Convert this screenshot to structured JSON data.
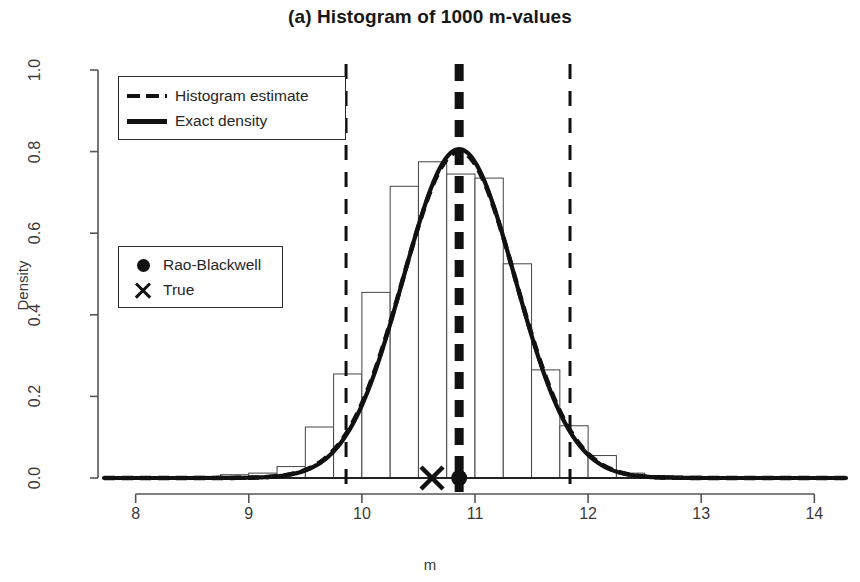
{
  "chart_data": {
    "type": "histogram",
    "title": "(a) Histogram of 1000 m-values",
    "xlabel": "m",
    "ylabel": "Density",
    "xlim": [
      7.72,
      14.28
    ],
    "ylim": [
      0.0,
      1.0
    ],
    "xticks": [
      8,
      9,
      10,
      11,
      12,
      13,
      14
    ],
    "xtick_labels": [
      "8",
      "9",
      "10",
      "11",
      "12",
      "13",
      "14"
    ],
    "yticks": [
      0.0,
      0.2,
      0.4,
      0.6,
      0.8,
      1.0
    ],
    "ytick_labels": [
      "0.0",
      "0.2",
      "0.4",
      "0.6",
      "0.8",
      "1.0"
    ],
    "grid": false,
    "bin_width": 0.25,
    "bins": [
      {
        "left": 8.5,
        "right": 8.75,
        "density": 0.004
      },
      {
        "left": 8.75,
        "right": 9.0,
        "density": 0.008
      },
      {
        "left": 9.0,
        "right": 9.25,
        "density": 0.012
      },
      {
        "left": 9.25,
        "right": 9.5,
        "density": 0.028
      },
      {
        "left": 9.5,
        "right": 9.75,
        "density": 0.125
      },
      {
        "left": 9.75,
        "right": 10.0,
        "density": 0.255
      },
      {
        "left": 10.0,
        "right": 10.25,
        "density": 0.455
      },
      {
        "left": 10.25,
        "right": 10.5,
        "density": 0.715
      },
      {
        "left": 10.5,
        "right": 10.75,
        "density": 0.775
      },
      {
        "left": 10.75,
        "right": 11.0,
        "density": 0.745
      },
      {
        "left": 11.0,
        "right": 11.25,
        "density": 0.735
      },
      {
        "left": 11.25,
        "right": 11.5,
        "density": 0.525
      },
      {
        "left": 11.5,
        "right": 11.75,
        "density": 0.265
      },
      {
        "left": 11.75,
        "right": 12.0,
        "density": 0.128
      },
      {
        "left": 12.0,
        "right": 12.25,
        "density": 0.055
      },
      {
        "left": 12.25,
        "right": 12.5,
        "density": 0.012
      },
      {
        "left": 12.5,
        "right": 12.75,
        "density": 0.006
      }
    ],
    "exact_density": {
      "label": "Exact density",
      "style": "solid",
      "mean": 10.86,
      "sd": 0.495,
      "peak": 0.806
    },
    "histogram_estimate": {
      "label": "Histogram estimate",
      "style": "dashed",
      "mean": 10.86,
      "sd": 0.5,
      "peak": 0.8
    },
    "vertical_lines": [
      {
        "name": "lower-bound",
        "x": 9.86,
        "style": "dashed",
        "width": 3
      },
      {
        "name": "rao-blackwell-estimate",
        "x": 10.86,
        "style": "dashed",
        "width": 9
      },
      {
        "name": "upper-bound",
        "x": 11.84,
        "style": "dashed",
        "width": 3
      }
    ],
    "markers": [
      {
        "name": "True",
        "x": 10.62,
        "y": 0.0,
        "symbol": "cross"
      },
      {
        "name": "Rao-Blackwell",
        "x": 10.86,
        "y": 0.0,
        "symbol": "filled-circle"
      }
    ]
  },
  "legend_lines": {
    "items": [
      {
        "label": "Histogram estimate",
        "key": "dashed-line-key"
      },
      {
        "label": "Exact density",
        "key": "solid-line-key"
      }
    ]
  },
  "legend_points": {
    "items": [
      {
        "label": "Rao-Blackwell",
        "key": "filled-circle-key"
      },
      {
        "label": "True",
        "key": "cross-key"
      }
    ]
  }
}
